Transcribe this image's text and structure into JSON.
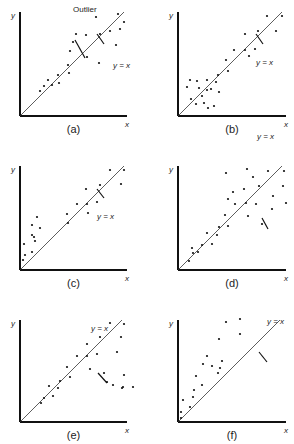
{
  "chart_data": [
    {
      "type": "scatter",
      "id": "a",
      "caption": "(a)",
      "xlabel": "x",
      "ylabel": "y",
      "reference_line": "y = x",
      "annotations": [
        {
          "text": "y = x",
          "pos": [
            101,
            48
          ],
          "arrow_to": [
            94,
            30
          ]
        },
        {
          "text": "Outlier",
          "pos": [
            61,
            104
          ],
          "arrow_to": [
            100,
            87
          ]
        }
      ],
      "origin": [
        20,
        116
      ],
      "size": [
        107,
        104
      ],
      "points": [
        [
          20,
          25
        ],
        [
          24,
          30
        ],
        [
          28,
          36
        ],
        [
          32,
          31
        ],
        [
          38,
          41
        ],
        [
          39,
          33
        ],
        [
          48,
          51
        ],
        [
          49,
          43
        ],
        [
          50,
          65
        ],
        [
          53,
          74
        ],
        [
          56,
          82
        ],
        [
          67,
          59
        ],
        [
          66,
          81
        ],
        [
          79,
          53
        ],
        [
          80,
          82
        ],
        [
          76,
          99
        ],
        [
          90,
          85
        ],
        [
          96,
          71
        ],
        [
          98,
          102
        ],
        [
          104,
          94
        ],
        [
          100,
          87
        ]
      ],
      "outlier": [
        100,
        87
      ]
    },
    {
      "type": "scatter",
      "id": "b",
      "caption": "(b)",
      "xlabel": "x",
      "ylabel": "y",
      "reference_line": "y = x",
      "origin": [
        178,
        116
      ],
      "size": [
        108,
        104
      ],
      "points": [
        [
          9,
          29
        ],
        [
          12,
          36
        ],
        [
          13,
          17
        ],
        [
          19,
          35
        ],
        [
          18,
          12
        ],
        [
          21,
          28
        ],
        [
          24,
          20
        ],
        [
          26,
          13
        ],
        [
          29,
          36
        ],
        [
          29,
          26
        ],
        [
          30,
          8
        ],
        [
          33,
          27
        ],
        [
          36,
          10
        ],
        [
          38,
          34
        ],
        [
          40,
          41
        ],
        [
          41,
          24
        ],
        [
          48,
          56
        ],
        [
          50,
          45
        ],
        [
          56,
          66
        ],
        [
          67,
          82
        ],
        [
          67,
          66
        ],
        [
          71,
          60
        ],
        [
          77,
          67
        ],
        [
          80,
          85
        ],
        [
          89,
          100
        ],
        [
          98,
          85
        ],
        [
          104,
          100
        ]
      ]
    },
    {
      "type": "scatter",
      "id": "c",
      "caption": "(c)",
      "xlabel": "x",
      "ylabel": "y",
      "reference_line": "y = x",
      "origin": [
        20,
        270
      ],
      "size": [
        107,
        104
      ],
      "points": [
        [
          3,
          10
        ],
        [
          5,
          15
        ],
        [
          4,
          26
        ],
        [
          12,
          18
        ],
        [
          12,
          45
        ],
        [
          12,
          35
        ],
        [
          15,
          29
        ],
        [
          14,
          33
        ],
        [
          17,
          53
        ],
        [
          20,
          42
        ],
        [
          47,
          56
        ],
        [
          48,
          47
        ],
        [
          57,
          66
        ],
        [
          66,
          81
        ],
        [
          67,
          66
        ],
        [
          68,
          57
        ],
        [
          77,
          68
        ],
        [
          80,
          85
        ],
        [
          90,
          100
        ],
        [
          101,
          86
        ],
        [
          104,
          100
        ]
      ]
    },
    {
      "type": "scatter",
      "id": "d",
      "caption": "(d)",
      "xlabel": "x",
      "ylabel": "y",
      "reference_line": "y = x",
      "annotations": [
        {
          "text": "y = x",
          "pos": [
            87,
            131
          ],
          "arrow_to": [
            87,
            73
          ]
        }
      ],
      "origin": [
        178,
        270
      ],
      "size": [
        108,
        104
      ],
      "points": [
        [
          11,
          9
        ],
        [
          14,
          22
        ],
        [
          15,
          17
        ],
        [
          20,
          18
        ],
        [
          24,
          25
        ],
        [
          29,
          37
        ],
        [
          34,
          26
        ],
        [
          39,
          35
        ],
        [
          41,
          43
        ],
        [
          47,
          55
        ],
        [
          48,
          97
        ],
        [
          50,
          71
        ],
        [
          50,
          44
        ],
        [
          55,
          78
        ],
        [
          57,
          66
        ],
        [
          66,
          81
        ],
        [
          68,
          67
        ],
        [
          70,
          54
        ],
        [
          75,
          93
        ],
        [
          78,
          66
        ],
        [
          81,
          84
        ],
        [
          84,
          46
        ],
        [
          90,
          99
        ],
        [
          94,
          61
        ],
        [
          95,
          74
        ],
        [
          105,
          84
        ],
        [
          106,
          99
        ],
        [
          108,
          67
        ],
        [
          69,
          101
        ]
      ]
    },
    {
      "type": "scatter",
      "id": "e",
      "caption": "(e)",
      "xlabel": "x",
      "ylabel": "y",
      "reference_line": "y = x",
      "annotations": [
        {
          "text": "y = x",
          "pos": [
            79,
            91
          ],
          "arrow_to": [
            78,
            50
          ]
        }
      ],
      "origin": [
        20,
        422
      ],
      "size": [
        107,
        102
      ],
      "points": [
        [
          21,
          19
        ],
        [
          24,
          24
        ],
        [
          29,
          36
        ],
        [
          33,
          26
        ],
        [
          38,
          34
        ],
        [
          40,
          41
        ],
        [
          47,
          55
        ],
        [
          50,
          45
        ],
        [
          57,
          66
        ],
        [
          67,
          78
        ],
        [
          67,
          66
        ],
        [
          70,
          53
        ],
        [
          77,
          68
        ],
        [
          80,
          85
        ],
        [
          84,
          49
        ],
        [
          90,
          99
        ],
        [
          93,
          37
        ],
        [
          97,
          70
        ],
        [
          101,
          85
        ],
        [
          102,
          34
        ],
        [
          104,
          98
        ],
        [
          104,
          47
        ],
        [
          113,
          35
        ],
        [
          103,
          35
        ],
        [
          87,
          40
        ]
      ]
    },
    {
      "type": "scatter",
      "id": "f",
      "caption": "(f)",
      "xlabel": "x",
      "ylabel": "y",
      "reference_line": "y = x",
      "annotations": [
        {
          "text": "y = x",
          "pos": [
            97,
            98
          ],
          "arrow_to": [
            86,
            76
          ]
        }
      ],
      "origin": [
        178,
        422
      ],
      "size": [
        108,
        102
      ],
      "points": [
        [
          3,
          4
        ],
        [
          3,
          10
        ],
        [
          5,
          22
        ],
        [
          12,
          15
        ],
        [
          15,
          25
        ],
        [
          16,
          32
        ],
        [
          18,
          46
        ],
        [
          24,
          37
        ],
        [
          25,
          58
        ],
        [
          29,
          66
        ],
        [
          34,
          56
        ],
        [
          40,
          49
        ],
        [
          44,
          61
        ],
        [
          41,
          83
        ],
        [
          48,
          100
        ],
        [
          62,
          103
        ],
        [
          62,
          88
        ],
        [
          42,
          54
        ]
      ]
    }
  ]
}
